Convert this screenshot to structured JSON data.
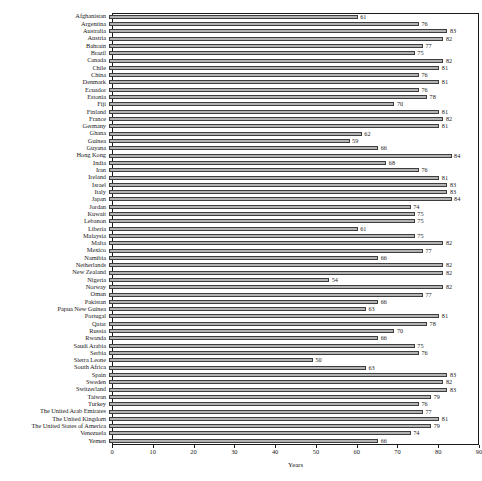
{
  "chart_data": {
    "type": "bar",
    "orientation": "horizontal",
    "title": "",
    "xlabel": "Years",
    "ylabel": "",
    "xlim": [
      0,
      90
    ],
    "xticks": [
      0,
      10,
      20,
      30,
      40,
      50,
      60,
      70,
      80,
      90
    ],
    "grid": false,
    "legend": false,
    "bar_color": "#b3b3b3",
    "bar_edge_color": "#3d3d3d",
    "axis_color": "#1a1a1a",
    "show_value_labels": true,
    "categories": [
      "Afghanistan",
      "Argentina",
      "Australia",
      "Austria",
      "Bahrain",
      "Brazil",
      "Canada",
      "Chile",
      "China",
      "Denmark",
      "Ecuador",
      "Estonia",
      "Fiji",
      "Finland",
      "France",
      "Germany",
      "Ghana",
      "Guinea",
      "Guyana",
      "Hong Kong",
      "India",
      "Iran",
      "Ireland",
      "Israel",
      "Italy",
      "Japan",
      "Jordan",
      "Kuwait",
      "Lebanon",
      "Liberia",
      "Malaysia",
      "Malta",
      "Mexico",
      "Namibia",
      "Netherlands",
      "New Zealand",
      "Nigeria",
      "Norway",
      "Oman",
      "Pakistan",
      "Papua New Guinea",
      "Portugal",
      "Qatar",
      "Russia",
      "Rwanda",
      "Saudi Arabia",
      "Serbia",
      "Sierra Leone",
      "South Africa",
      "Spain",
      "Sweden",
      "Switzerland",
      "Taiwan",
      "Turkey",
      "The United Arab Emirates",
      "The United Kingdom",
      "The United States of America",
      "Venezuela",
      "Yemen"
    ],
    "values": [
      61,
      76,
      83,
      82,
      77,
      75,
      82,
      81,
      76,
      81,
      76,
      78,
      70,
      81,
      82,
      81,
      62,
      59,
      66,
      84,
      68,
      76,
      81,
      83,
      83,
      84,
      74,
      75,
      75,
      61,
      75,
      82,
      77,
      66,
      82,
      82,
      54,
      82,
      77,
      66,
      63,
      81,
      78,
      70,
      66,
      75,
      76,
      50,
      63,
      83,
      82,
      83,
      79,
      76,
      77,
      81,
      79,
      74,
      66
    ]
  }
}
